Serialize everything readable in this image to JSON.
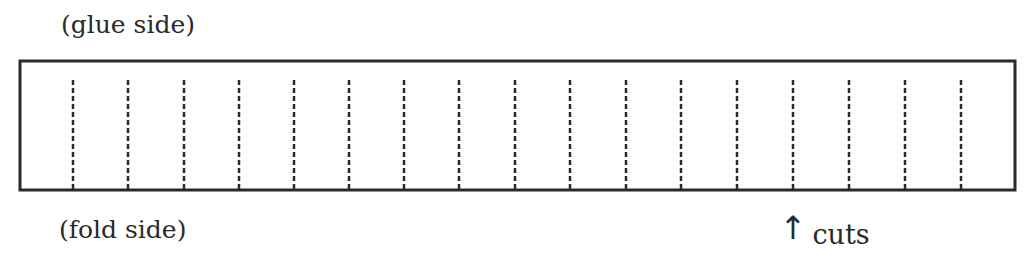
{
  "diagram": {
    "top_label": "(glue side)",
    "bottom_label": "(fold side)",
    "pointer": {
      "arrow_glyph": "↑",
      "label": "cuts",
      "points_to_cut_index": 13
    },
    "strip": {
      "x": 20,
      "y": 61,
      "width": 995,
      "height": 129,
      "stroke": "#2a2a2a"
    },
    "cut_lines": {
      "count": 17,
      "x_positions": [
        73,
        128,
        184,
        239,
        294,
        349,
        404,
        459,
        515,
        570,
        626,
        681,
        737,
        793,
        849,
        905,
        961
      ],
      "y_top": 80,
      "y_bottom": 190,
      "style": "dashed",
      "color": "#2a2a2a"
    }
  }
}
